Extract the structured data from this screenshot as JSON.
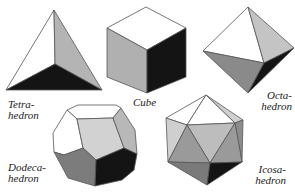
{
  "colors": {
    "face_white": "#ffffff",
    "face_light": "#c8c8c8",
    "face_mid": "#a8a8a8",
    "face_dark": "#7a7a7a",
    "face_black": "#141414",
    "edge": "#555555"
  },
  "solids": [
    {
      "name": "tetrahedron",
      "label_line1": "Tetra-",
      "label_line2": "hedron"
    },
    {
      "name": "cube",
      "label_line1": "Cube",
      "label_line2": ""
    },
    {
      "name": "octahedron",
      "label_line1": "Octa-",
      "label_line2": "hedron"
    },
    {
      "name": "dodecahedron",
      "label_line1": "Dodeca-",
      "label_line2": "hedron"
    },
    {
      "name": "icosahedron",
      "label_line1": "Icosa-",
      "label_line2": "hedron"
    }
  ]
}
